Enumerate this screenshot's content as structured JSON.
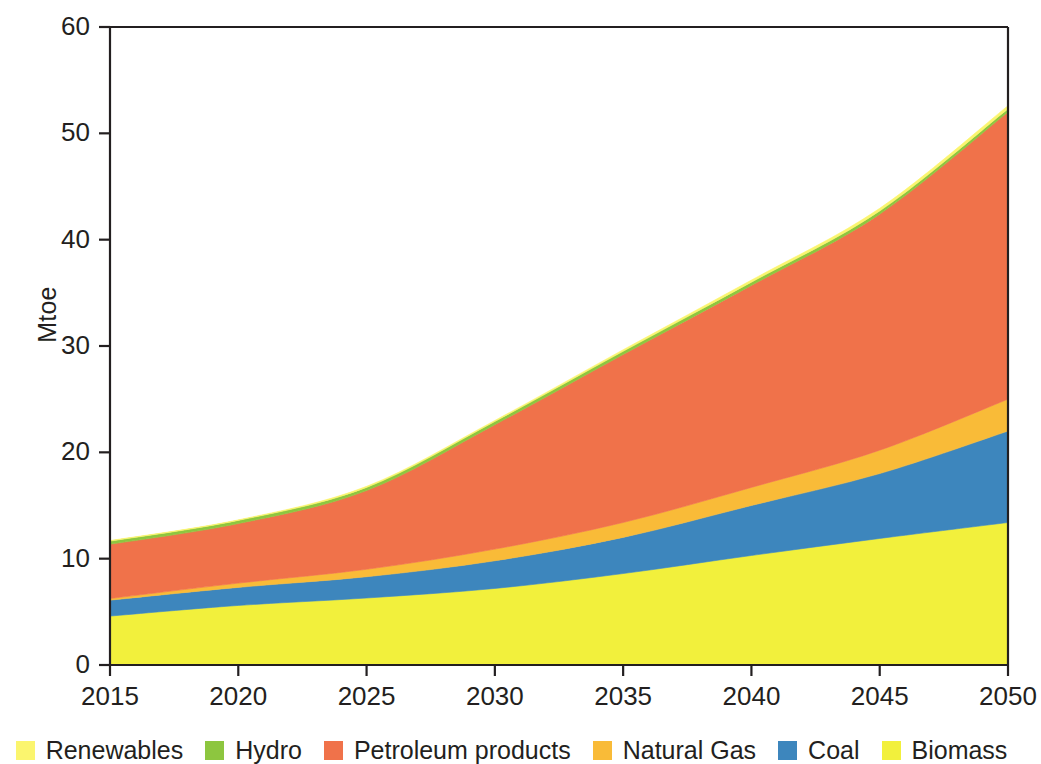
{
  "chart_data": {
    "type": "area",
    "title": "",
    "subtitle": "",
    "xlabel": "",
    "ylabel": "Mtoe",
    "xlim": [
      2015,
      2050
    ],
    "ylim": [
      0,
      60
    ],
    "ytick_labels": [
      "0",
      "10",
      "20",
      "30",
      "40",
      "50",
      "60"
    ],
    "yticks": [
      0,
      10,
      20,
      30,
      40,
      50,
      60
    ],
    "xtick_labels": [
      "2015",
      "2020",
      "2025",
      "2030",
      "2035",
      "2040",
      "2045",
      "2050"
    ],
    "xticks": [
      2015,
      2020,
      2025,
      2030,
      2035,
      2040,
      2045,
      2050
    ],
    "grid": false,
    "stacked": true,
    "legend_position": "bottom",
    "x": [
      2015,
      2020,
      2025,
      2030,
      2035,
      2040,
      2045,
      2050
    ],
    "series": [
      {
        "name": "Biomass",
        "color": "#f2f03c",
        "values": [
          4.6,
          5.6,
          6.3,
          7.2,
          8.6,
          10.3,
          11.9,
          13.4
        ]
      },
      {
        "name": "Coal",
        "color": "#3d86bd",
        "values": [
          1.5,
          1.7,
          2.0,
          2.6,
          3.4,
          4.7,
          6.1,
          8.6
        ]
      },
      {
        "name": "Natural Gas",
        "color": "#f9bb38",
        "values": [
          0.15,
          0.4,
          0.7,
          1.1,
          1.4,
          1.7,
          2.2,
          3.0
        ]
      },
      {
        "name": "Petroleum products",
        "color": "#f0724a",
        "values": [
          5.1,
          5.6,
          7.4,
          11.7,
          15.8,
          19.0,
          22.2,
          27.0
        ]
      },
      {
        "name": "Hydro",
        "color": "#8dc63f",
        "values": [
          0.3,
          0.3,
          0.3,
          0.3,
          0.3,
          0.3,
          0.3,
          0.3
        ]
      },
      {
        "name": "Renewables",
        "color": "#fbf56e",
        "values": [
          0.05,
          0.05,
          0.1,
          0.1,
          0.15,
          0.2,
          0.25,
          0.3
        ]
      }
    ],
    "totals": [
      11.7,
      13.65,
      16.8,
      23.0,
      29.65,
      36.2,
      42.95,
      52.6
    ]
  },
  "legend": {
    "items": [
      {
        "label": "Renewables",
        "color": "#fbf56e"
      },
      {
        "label": "Hydro",
        "color": "#8dc63f"
      },
      {
        "label": "Petroleum products",
        "color": "#f0724a"
      },
      {
        "label": "Natural Gas",
        "color": "#f9bb38"
      },
      {
        "label": "Coal",
        "color": "#3d86bd"
      },
      {
        "label": "Biomass",
        "color": "#f2f03c"
      }
    ]
  },
  "axes": {
    "y_title": "Mtoe",
    "frame_color": "#231f20"
  }
}
